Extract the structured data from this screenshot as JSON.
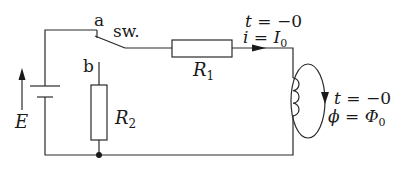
{
  "diagram": {
    "type": "circuit",
    "colors": {
      "line": "#2a2a2a",
      "background": "#ffffff"
    },
    "labels": {
      "source": "E",
      "switch_name": "sw.",
      "contact_a": "a",
      "contact_b": "b",
      "r1": {
        "main": "R",
        "sub": "1"
      },
      "r2": {
        "main": "R",
        "sub": "2"
      },
      "current_time": {
        "var": "t",
        "eq": " = −0"
      },
      "current_value": {
        "var": "i",
        "eq": " = ",
        "rhs": "I",
        "sub": "0"
      },
      "flux_time": {
        "var": "t",
        "eq": " = −0"
      },
      "flux_value": {
        "var": "ϕ",
        "eq": " = ",
        "rhs": "Φ",
        "sub": "0"
      }
    },
    "components": [
      {
        "id": "E",
        "kind": "voltage-source"
      },
      {
        "id": "sw",
        "kind": "switch",
        "position": "a"
      },
      {
        "id": "R1",
        "kind": "resistor"
      },
      {
        "id": "R2",
        "kind": "resistor"
      },
      {
        "id": "L",
        "kind": "inductor"
      }
    ]
  }
}
